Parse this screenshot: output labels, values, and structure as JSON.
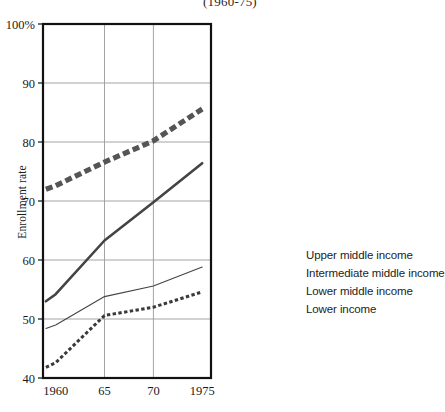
{
  "chart_data": {
    "type": "line",
    "title": "(1960-75)",
    "xlabel": "",
    "ylabel": "Enrollment rate",
    "x": [
      1959,
      1960,
      1965,
      1970,
      1975
    ],
    "xtick_labels": [
      "1960",
      "65",
      "70",
      "1975"
    ],
    "xtick_values": [
      1960,
      1965,
      1970,
      1975
    ],
    "ytick_labels": [
      "100%",
      "90",
      "80",
      "70",
      "60",
      "50",
      "40"
    ],
    "ytick_values": [
      100,
      90,
      80,
      70,
      60,
      50,
      40
    ],
    "ylim": [
      40,
      100
    ],
    "xlim": [
      1958.7,
      1975.9
    ],
    "grid": true,
    "legend_position": "right",
    "series": [
      {
        "name": "Upper middle income",
        "style": "thick-dashed",
        "color": "#555555",
        "values": [
          72.0,
          72.6,
          76.6,
          80.2,
          85.6
        ]
      },
      {
        "name": "Intermediate middle income",
        "style": "thick-solid",
        "color": "#444444",
        "values": [
          53.0,
          54.2,
          63.3,
          69.8,
          76.4
        ]
      },
      {
        "name": "Lower middle income",
        "style": "thin-solid",
        "color": "#444444",
        "values": [
          48.4,
          49.0,
          53.8,
          55.6,
          58.8
        ]
      },
      {
        "name": "Lower income",
        "style": "dotted",
        "color": "#3a3a3a",
        "values": [
          41.8,
          42.6,
          50.6,
          52.0,
          54.6
        ]
      }
    ]
  },
  "legend": {
    "items": [
      {
        "label": "Upper middle income",
        "key": "thick-dashed-key"
      },
      {
        "label": "Intermediate middle income",
        "key": "thick-solid-key"
      },
      {
        "label": "Lower middle income",
        "key": "thin-solid-key"
      },
      {
        "label": "Lower income",
        "key": "dotted-key"
      }
    ]
  },
  "axes": {
    "y_title": "Enrollment rate"
  }
}
